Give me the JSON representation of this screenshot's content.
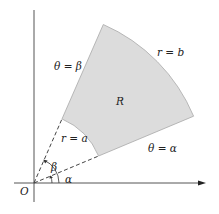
{
  "figure": {
    "region_label": "R",
    "origin_label": "O",
    "outer_arc_label": "r = b",
    "inner_arc_label": "r = a",
    "ray_alpha_label": "θ = α",
    "ray_beta_label": "θ = β",
    "angle_alpha_label": "α",
    "angle_beta_label": "β"
  },
  "colors": {
    "region_fill": "#dcdcdc",
    "region_edge": "#a8a8a8",
    "axis": "#555555",
    "text": "#222222"
  },
  "geometry": {
    "origin": [
      34,
      183
    ],
    "alpha_deg": 22.7,
    "beta_deg": 66.4,
    "a": 70,
    "b": 173
  }
}
